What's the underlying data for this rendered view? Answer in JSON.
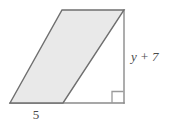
{
  "figure": {
    "type": "parallelogram-with-height",
    "colors": {
      "background": "#ffffff",
      "shape_fill": "#e9e9e9",
      "shape_stroke": "#6f6f6f",
      "helper_line": "#8a8a8a",
      "right_angle": "#9a9a9a",
      "label_text": "#4a4a4a"
    },
    "shape": {
      "name": "parallelogram",
      "vertices": [
        {
          "name": "bottom-left",
          "x": 10,
          "y": 103
        },
        {
          "name": "bottom-right",
          "x": 63,
          "y": 103
        },
        {
          "name": "top-right",
          "x": 124,
          "y": 10
        },
        {
          "name": "top-left",
          "x": 62,
          "y": 10
        }
      ]
    },
    "base_line": {
      "x1": 10,
      "y1": 103,
      "x2": 124,
      "y2": 103
    },
    "height_line": {
      "x1": 124,
      "y1": 10,
      "x2": 124,
      "y2": 103
    },
    "right_angle_marker": {
      "x": 112,
      "y": 91,
      "size": 12
    },
    "labels": {
      "base": {
        "text": "5",
        "x": 36,
        "y": 118,
        "italic": false
      },
      "height": {
        "text": "y + 7",
        "x": 131,
        "y": 61,
        "italic": true,
        "variable": "y",
        "operator": "+",
        "constant": "7"
      }
    }
  }
}
